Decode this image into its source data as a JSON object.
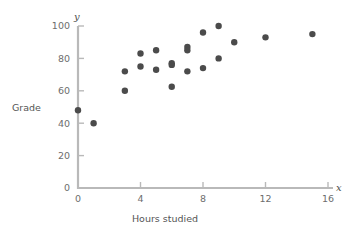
{
  "chart_data": {
    "type": "scatter",
    "title": "",
    "xlabel": "Hours studied",
    "ylabel": "Grade",
    "x_var_symbol": "x",
    "y_var_symbol": "y",
    "xlim": [
      0,
      16
    ],
    "ylim": [
      0,
      100
    ],
    "xticks": [
      0,
      4,
      8,
      12,
      16
    ],
    "yticks": [
      0,
      20,
      40,
      60,
      80,
      100
    ],
    "xtick_labels": [
      "0",
      "4",
      "8",
      "12",
      "16"
    ],
    "ytick_labels": [
      "0",
      "20",
      "40",
      "60",
      "80",
      "100"
    ],
    "grid": false,
    "legend": null,
    "point_color": "#4b4b4b",
    "axis_color": "#b9b9b9",
    "label_color": "#5a5a5a",
    "points": [
      {
        "x": 0,
        "y": 48
      },
      {
        "x": 1,
        "y": 40
      },
      {
        "x": 3,
        "y": 72
      },
      {
        "x": 3,
        "y": 60
      },
      {
        "x": 4,
        "y": 83
      },
      {
        "x": 4,
        "y": 75
      },
      {
        "x": 5,
        "y": 85
      },
      {
        "x": 5,
        "y": 73
      },
      {
        "x": 6,
        "y": 77
      },
      {
        "x": 6,
        "y": 76
      },
      {
        "x": 6,
        "y": 62.5
      },
      {
        "x": 7,
        "y": 87
      },
      {
        "x": 7,
        "y": 85
      },
      {
        "x": 7,
        "y": 72
      },
      {
        "x": 8,
        "y": 96
      },
      {
        "x": 8,
        "y": 74
      },
      {
        "x": 9,
        "y": 100
      },
      {
        "x": 9,
        "y": 80
      },
      {
        "x": 10,
        "y": 90
      },
      {
        "x": 12,
        "y": 93
      },
      {
        "x": 15,
        "y": 95
      }
    ]
  },
  "geometry": {
    "x_origin_px": 78,
    "y_origin_px": 188,
    "x_max_px": 328,
    "y_max_px": 26,
    "point_radius_px": 3.2
  }
}
